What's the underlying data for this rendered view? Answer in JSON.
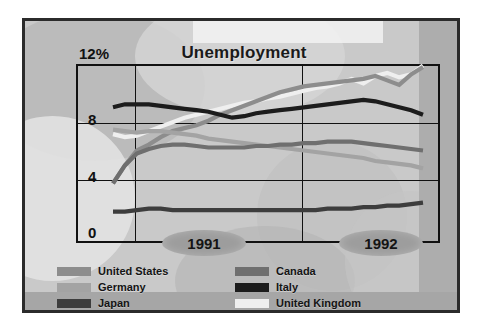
{
  "chart_data": {
    "type": "line",
    "title": "Unemployment",
    "xlabel": "",
    "ylabel": "",
    "y_unit": "%",
    "ylim": [
      0,
      12
    ],
    "yticks": [
      "0",
      "4",
      "8",
      "12%"
    ],
    "ytick_values": [
      0,
      4,
      8,
      12
    ],
    "grid": true,
    "legend_position": "bottom",
    "x_axis_labels": [
      "1991",
      "1992"
    ],
    "x_gridline_labels": [
      "1991",
      "1992"
    ],
    "x_note": "monthly points spanning late 1990 through 1992",
    "x": [
      0,
      1,
      2,
      3,
      4,
      5,
      6,
      7,
      8,
      9,
      10,
      11,
      12,
      13,
      14,
      15,
      16,
      17,
      18,
      19,
      20,
      21,
      22,
      23,
      24,
      25,
      26
    ],
    "series": [
      {
        "name": "United States",
        "color": "#8d8d8d",
        "values": [
          4.0,
          5.2,
          6.2,
          6.6,
          7.1,
          7.5,
          7.7,
          7.9,
          8.2,
          8.6,
          8.9,
          9.2,
          9.5,
          9.8,
          10.1,
          10.3,
          10.5,
          10.6,
          10.7,
          10.8,
          10.9,
          11.0,
          11.2,
          10.9,
          10.6,
          11.3,
          11.8
        ]
      },
      {
        "name": "Germany",
        "color": "#a3a3a3",
        "values": [
          7.6,
          7.5,
          7.4,
          7.5,
          7.5,
          7.4,
          7.3,
          7.2,
          7.0,
          6.9,
          6.8,
          6.7,
          6.6,
          6.5,
          6.4,
          6.3,
          6.2,
          6.1,
          6.0,
          5.9,
          5.8,
          5.7,
          5.5,
          5.4,
          5.3,
          5.2,
          5.0
        ]
      },
      {
        "name": "Japan",
        "color": "#3d3d3d",
        "values": [
          2.1,
          2.1,
          2.2,
          2.3,
          2.3,
          2.2,
          2.2,
          2.2,
          2.2,
          2.2,
          2.2,
          2.2,
          2.2,
          2.2,
          2.2,
          2.2,
          2.2,
          2.2,
          2.3,
          2.3,
          2.3,
          2.4,
          2.4,
          2.5,
          2.5,
          2.6,
          2.7
        ]
      },
      {
        "name": "Canada",
        "color": "#6f6f6f",
        "values": [
          4.0,
          5.2,
          6.0,
          6.3,
          6.5,
          6.6,
          6.6,
          6.5,
          6.4,
          6.4,
          6.4,
          6.4,
          6.5,
          6.5,
          6.6,
          6.6,
          6.7,
          6.7,
          6.8,
          6.8,
          6.8,
          6.7,
          6.6,
          6.5,
          6.4,
          6.3,
          6.2
        ]
      },
      {
        "name": "Italy",
        "color": "#1c1c1c",
        "values": [
          9.1,
          9.3,
          9.3,
          9.3,
          9.2,
          9.1,
          9.0,
          8.9,
          8.8,
          8.6,
          8.4,
          8.5,
          8.7,
          8.8,
          8.9,
          9.0,
          9.1,
          9.2,
          9.3,
          9.4,
          9.5,
          9.6,
          9.5,
          9.3,
          9.1,
          8.9,
          8.6
        ]
      },
      {
        "name": "United Kingdom",
        "color": "#efefef",
        "values": [
          7.3,
          7.1,
          7.2,
          7.5,
          7.8,
          8.1,
          8.4,
          8.6,
          8.8,
          9.0,
          9.2,
          9.4,
          9.5,
          9.7,
          9.8,
          10.0,
          10.2,
          10.4,
          10.5,
          10.7,
          11.0,
          10.7,
          11.2,
          11.4,
          11.1,
          11.3,
          11.9
        ]
      }
    ]
  },
  "chart": {
    "title": "Unemployment",
    "y_top_label": "12%",
    "y_labels": [
      "8",
      "4",
      "0"
    ],
    "year_left": "1991",
    "year_right": "1992"
  },
  "legend": {
    "left_column": [
      {
        "label": "United States",
        "color": "#8d8d8d"
      },
      {
        "label": "Germany",
        "color": "#a3a3a3"
      },
      {
        "label": "Japan",
        "color": "#3d3d3d"
      }
    ],
    "right_column": [
      {
        "label": "Canada",
        "color": "#6f6f6f"
      },
      {
        "label": "Italy",
        "color": "#1c1c1c"
      },
      {
        "label": "United Kingdom",
        "color": "#efefef"
      }
    ]
  }
}
